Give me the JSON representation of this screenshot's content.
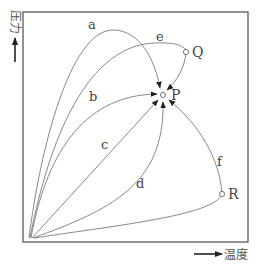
{
  "diagram": {
    "title": "",
    "axes": {
      "y_label": "压力",
      "x_label": "温度"
    },
    "points": [
      {
        "id": "P",
        "label": "P"
      },
      {
        "id": "Q",
        "label": "Q"
      },
      {
        "id": "R",
        "label": "R"
      }
    ],
    "curves": [
      {
        "id": "a",
        "label": "a",
        "from": "origin",
        "to": "P"
      },
      {
        "id": "b",
        "label": "b",
        "from": "origin",
        "to": "P"
      },
      {
        "id": "c",
        "label": "c",
        "from": "origin",
        "to": "P"
      },
      {
        "id": "d",
        "label": "d",
        "from": "origin",
        "to": "P"
      },
      {
        "id": "e",
        "label": "e",
        "from": "origin",
        "to": "P",
        "via": "Q"
      },
      {
        "id": "f",
        "label": "f",
        "from": "origin",
        "to": "P",
        "via": "R"
      }
    ],
    "colors": {
      "frame": "#5a5a5a",
      "curve": "#7a7a7a",
      "arrowhead": "#222222",
      "text": "#444444"
    }
  }
}
